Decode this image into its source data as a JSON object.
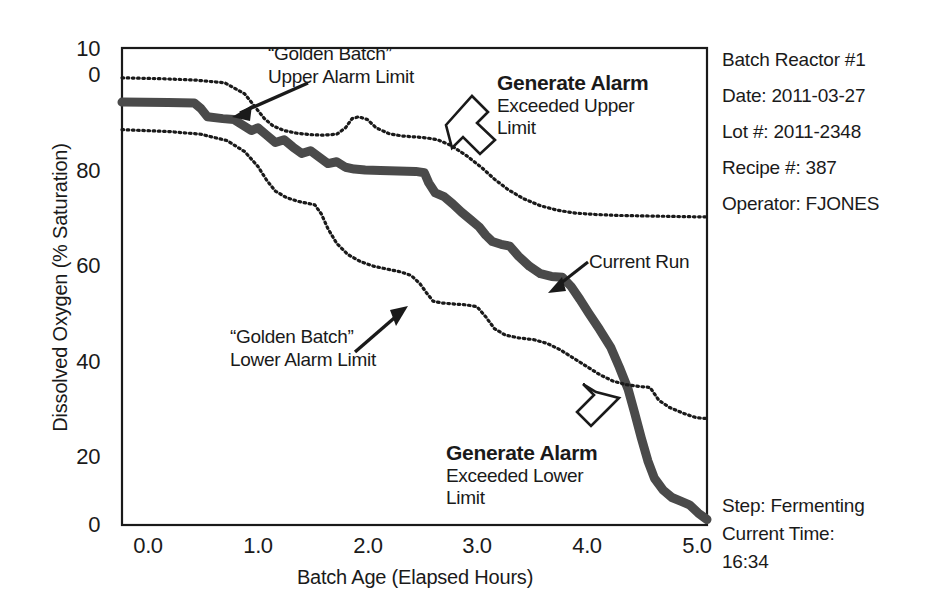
{
  "chart_data": {
    "type": "line",
    "title": "",
    "xlabel": "Batch Age (Elapsed Hours)",
    "ylabel": "Dissolved Oxygen (% Saturation)",
    "xlim": [
      -0.22,
      5.12
    ],
    "ylim": [
      0,
      104
    ],
    "grid": false,
    "legend": "none",
    "xticks": [
      "0.0",
      "1.0",
      "2.0",
      "3.0",
      "4.0",
      "5.0"
    ],
    "xtick_values": [
      0.0,
      1.0,
      2.0,
      3.0,
      4.0,
      5.0
    ],
    "yticks": [
      "100",
      "80",
      "60",
      "40",
      "20",
      "0"
    ],
    "ytick_values": [
      100,
      80,
      60,
      40,
      20,
      0
    ],
    "ytick_top_wrapped": [
      "10",
      "0"
    ],
    "series": [
      {
        "name": "“Golden Batch” Upper Alarm Limit",
        "style": "dotted",
        "color": "#1a1a1a",
        "x": [
          -0.22,
          0.15,
          0.45,
          0.72,
          0.9,
          1.0,
          1.08,
          1.16,
          1.26,
          1.38,
          1.5,
          1.62,
          1.74,
          1.82,
          1.88,
          1.94,
          2.02,
          2.1,
          2.22,
          2.34,
          2.46,
          2.56,
          2.66,
          2.78,
          2.92,
          3.06,
          3.18,
          3.3,
          3.44,
          3.6,
          3.76,
          3.92,
          4.1,
          4.3,
          4.52,
          4.76,
          5.0,
          5.12
        ],
        "y": [
          97.5,
          97.3,
          97.0,
          96.4,
          94.0,
          91.0,
          88.6,
          87.0,
          86.0,
          85.4,
          85.1,
          85.0,
          85.2,
          86.6,
          88.6,
          89.0,
          88.4,
          86.6,
          85.3,
          84.8,
          84.6,
          84.4,
          84.0,
          82.8,
          80.6,
          78.0,
          75.4,
          73.2,
          71.2,
          69.6,
          68.6,
          68.0,
          67.7,
          67.5,
          67.4,
          67.3,
          67.2,
          67.2
        ]
      },
      {
        "name": "Current Run",
        "style": "solid-thick",
        "color": "#4a4a4a",
        "x": [
          -0.22,
          0.2,
          0.44,
          0.5,
          0.56,
          0.7,
          0.8,
          0.88,
          0.96,
          1.02,
          1.1,
          1.18,
          1.26,
          1.34,
          1.42,
          1.5,
          1.58,
          1.66,
          1.74,
          1.82,
          1.9,
          2.0,
          2.14,
          2.3,
          2.46,
          2.54,
          2.58,
          2.64,
          2.72,
          2.8,
          2.88,
          2.96,
          3.04,
          3.1,
          3.16,
          3.24,
          3.32,
          3.4,
          3.5,
          3.6,
          3.7,
          3.8,
          3.88,
          3.96,
          4.04,
          4.14,
          4.24,
          4.32,
          4.4,
          4.46,
          4.52,
          4.58,
          4.64,
          4.72,
          4.8,
          4.88,
          4.96,
          5.04,
          5.12
        ],
        "y": [
          92.2,
          92.1,
          92.0,
          90.8,
          89.0,
          88.6,
          88.4,
          87.2,
          86.0,
          86.6,
          85.0,
          83.4,
          84.0,
          82.4,
          81.0,
          81.6,
          80.2,
          78.8,
          79.2,
          78.0,
          77.6,
          77.4,
          77.3,
          77.2,
          77.1,
          76.8,
          74.6,
          72.4,
          71.6,
          70.0,
          68.2,
          66.6,
          65.0,
          63.2,
          61.8,
          61.2,
          60.8,
          58.6,
          56.4,
          54.8,
          54.2,
          54.0,
          52.0,
          49.2,
          46.2,
          42.6,
          38.8,
          34.4,
          29.6,
          24.4,
          19.0,
          14.0,
          10.2,
          7.6,
          6.0,
          5.2,
          4.4,
          2.6,
          1.2
        ]
      },
      {
        "name": "“Golden Batch” Lower Alarm Limit",
        "style": "dotted",
        "color": "#1a1a1a",
        "x": [
          -0.22,
          0.2,
          0.5,
          0.74,
          0.9,
          1.02,
          1.1,
          1.18,
          1.28,
          1.38,
          1.46,
          1.54,
          1.6,
          1.66,
          1.74,
          1.84,
          1.96,
          2.08,
          2.2,
          2.32,
          2.42,
          2.5,
          2.56,
          2.62,
          2.7,
          2.8,
          2.92,
          3.02,
          3.1,
          3.18,
          3.28,
          3.4,
          3.54,
          3.66,
          3.78,
          3.9,
          4.02,
          4.14,
          4.26,
          4.38,
          4.5,
          4.6,
          4.68,
          4.78,
          4.9,
          5.02,
          5.12
        ],
        "y": [
          86.2,
          85.8,
          85.2,
          83.8,
          81.4,
          78.2,
          75.2,
          72.8,
          71.4,
          70.6,
          70.2,
          69.8,
          67.8,
          64.6,
          61.4,
          59.0,
          57.4,
          56.4,
          55.8,
          55.2,
          54.4,
          52.6,
          50.6,
          48.8,
          48.4,
          48.2,
          48.0,
          47.6,
          45.4,
          42.8,
          41.4,
          40.8,
          40.4,
          39.6,
          38.2,
          36.4,
          34.6,
          32.8,
          31.4,
          30.6,
          30.2,
          30.0,
          27.2,
          25.6,
          24.4,
          23.4,
          23.2
        ]
      }
    ],
    "annotations": [
      {
        "id": "upper-limit-anno",
        "title": "“Golden Batch”",
        "subtitle": "Upper Alarm Limit",
        "arrow": "solid-down-left"
      },
      {
        "id": "alarm-upper-anno",
        "title": "Generate Alarm",
        "subtitle": "Exceeded Upper",
        "subtitle2": "Limit",
        "arrow": "hollow-down-left"
      },
      {
        "id": "lower-limit-anno",
        "title": "“Golden Batch”",
        "subtitle": "Lower Alarm Limit",
        "arrow": "solid-up-right"
      },
      {
        "id": "current-run-anno",
        "title": "Current Run",
        "arrow": "solid-down-left"
      },
      {
        "id": "alarm-lower-anno",
        "title": "Generate Alarm",
        "subtitle": "Exceeded Lower",
        "subtitle2": "Limit",
        "arrow": "hollow-up-right"
      }
    ]
  },
  "annotations": {
    "upper_limit": {
      "line1": "“Golden Batch”",
      "line2": "Upper Alarm Limit"
    },
    "alarm_upper": {
      "line1": "Generate Alarm",
      "line2": "Exceeded Upper",
      "line3": "Limit"
    },
    "lower_limit": {
      "line1": "“Golden Batch”",
      "line2": "Lower Alarm Limit"
    },
    "current_run": {
      "line1": "Current Run"
    },
    "alarm_lower": {
      "line1": "Generate Alarm",
      "line2": "Exceeded Lower",
      "line3": "Limit"
    }
  },
  "info_panel": {
    "reactor": "Batch Reactor #1",
    "date": "Date: 2011-03-27",
    "lot": "Lot #: 2011-2348",
    "recipe": "Recipe #: 387",
    "operator": "Operator: FJONES",
    "step": "Step: Fermenting",
    "current_time_label": "Current Time:",
    "current_time_value": "16:34"
  },
  "axes": {
    "y_title": "Dissolved Oxygen (% Saturation)",
    "x_title": "Batch Age (Elapsed Hours)",
    "y_tick_100_a": "10",
    "y_tick_100_b": "0",
    "y_tick_80": "80",
    "y_tick_60": "60",
    "y_tick_40": "40",
    "y_tick_20": "20",
    "y_tick_0": "0",
    "x_tick_0": "0.0",
    "x_tick_1": "1.0",
    "x_tick_2": "2.0",
    "x_tick_3": "3.0",
    "x_tick_4": "4.0",
    "x_tick_5": "5.0"
  },
  "colors": {
    "ink": "#1a1a1a",
    "current_run": "#4a4a4a",
    "frame": "#1a1a1a",
    "background": "#ffffff"
  }
}
